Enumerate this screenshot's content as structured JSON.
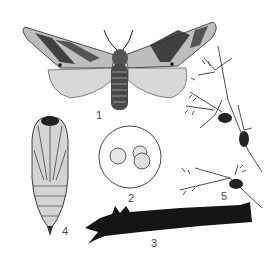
{
  "figure": {
    "type": "entomological illustration",
    "panels": [
      {
        "id": "adult-moth",
        "label": "1"
      },
      {
        "id": "eggs",
        "label": "2"
      },
      {
        "id": "larva",
        "label": "3"
      },
      {
        "id": "pupa",
        "label": "4"
      },
      {
        "id": "cocoons-on-twig",
        "label": "5"
      }
    ]
  },
  "colors": {
    "ink": "#1a1a1a",
    "mid_gray": "#8a8a8a",
    "light_gray": "#d0d0d0",
    "label": "#4a4a4a"
  }
}
